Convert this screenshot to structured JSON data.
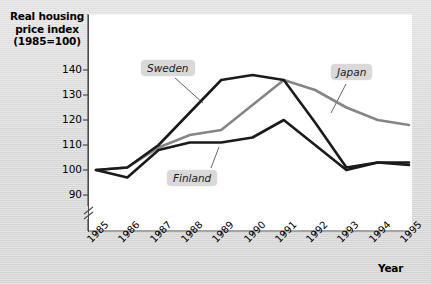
{
  "chart_data": {
    "type": "line",
    "title": "",
    "ylabel": "Real housing price index (1985=100)",
    "xlabel": "Year",
    "categories": [
      "1985",
      "1986",
      "1987",
      "1988",
      "1989",
      "1990",
      "1991",
      "1992",
      "1993",
      "1994",
      "1995"
    ],
    "ylim": [
      86,
      145
    ],
    "y_ticks": [
      90,
      100,
      110,
      120,
      130,
      140
    ],
    "y_axis_break": true,
    "grid": false,
    "legend_position": "inline-callouts",
    "series": [
      {
        "name": "Sweden",
        "color": "#1a1a1a",
        "values": [
          100,
          101,
          110,
          123,
          136,
          138,
          136,
          119,
          101,
          103,
          103
        ]
      },
      {
        "name": "Japan",
        "color": "#858585",
        "values": [
          100,
          101,
          109,
          114,
          116,
          126,
          136,
          132,
          125,
          120,
          118
        ]
      },
      {
        "name": "Finland",
        "color": "#1a1a1a",
        "values": [
          100,
          97,
          108,
          111,
          111,
          113,
          120,
          110,
          100,
          103,
          102
        ]
      }
    ]
  },
  "labels": {
    "y_axis_title": "Real housing price index (1985=100)",
    "y_axis_title_line1": "Real housing",
    "y_axis_title_line2": "price index",
    "y_axis_title_line3": "(1985=100)",
    "x_axis_title": "Year",
    "callout_sweden": "Sweden",
    "callout_japan": "Japan",
    "callout_finland": "Finland"
  },
  "colors": {
    "background": "#dcdcdc",
    "plot_background": "#ffffff",
    "axis": "#4a4a4a",
    "sweden": "#1a1a1a",
    "japan": "#858585",
    "finland": "#1a1a1a",
    "callout_background": "#d9d9d9"
  }
}
